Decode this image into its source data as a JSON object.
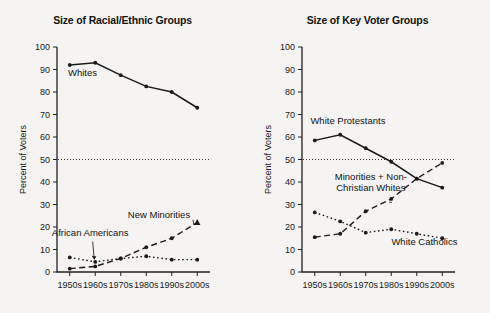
{
  "figure": {
    "background_color": "#f5f4f2",
    "ink_color": "#1a1a1a",
    "y_axis_title": "Percent of Voters"
  },
  "chart_data": [
    {
      "type": "line",
      "title": "Size of Racial/Ethnic Groups",
      "xlabel": "",
      "ylabel": "Percent of Voters",
      "categories": [
        "1950s",
        "1960s",
        "1970s",
        "1980s",
        "1990s",
        "2000s"
      ],
      "ylim": [
        0,
        100
      ],
      "yticks": [
        0,
        10,
        20,
        30,
        40,
        50,
        60,
        70,
        80,
        90,
        100
      ],
      "grid": false,
      "legend": "inline-annotations",
      "reference_line": {
        "value": 50,
        "style": "dotted"
      },
      "series": [
        {
          "name": "Whites",
          "style": "solid",
          "marker": "dot",
          "values": [
            92,
            93,
            87.5,
            82.5,
            80,
            73
          ],
          "label": "Whites",
          "label_x": "1955",
          "label_y": 87
        },
        {
          "name": "African Americans",
          "style": "dotted",
          "marker": "dot",
          "values": [
            6.5,
            4.5,
            6,
            7,
            5.5,
            5.5
          ],
          "label": "African Americans",
          "label_x": "1958",
          "label_y": 16
        },
        {
          "name": "New Minorities",
          "style": "dashed",
          "marker": "triangle",
          "values": [
            1.5,
            2.5,
            6,
            11,
            15,
            22
          ],
          "label": "New Minorities",
          "label_x": "1985",
          "label_y": 24
        }
      ]
    },
    {
      "type": "line",
      "title": "Size of Key Voter Groups",
      "xlabel": "",
      "ylabel": "Percent of Voters",
      "categories": [
        "1950s",
        "1960s",
        "1970s",
        "1980s",
        "1990s",
        "2000s"
      ],
      "ylim": [
        0,
        100
      ],
      "yticks": [
        0,
        10,
        20,
        30,
        40,
        50,
        60,
        70,
        80,
        90,
        100
      ],
      "grid": false,
      "legend": "inline-annotations",
      "reference_line": {
        "value": 50,
        "style": "dotted"
      },
      "series": [
        {
          "name": "White Protestants",
          "style": "solid",
          "marker": "dot",
          "values": [
            58.5,
            61,
            55,
            49,
            41.5,
            37.5
          ],
          "label": "White Protestants",
          "label_x": "1963",
          "label_y": 66
        },
        {
          "name": "White Catholics",
          "style": "dotted",
          "marker": "dot",
          "values": [
            26.5,
            22.5,
            17.5,
            19,
            17,
            15
          ],
          "label": "White Catholics",
          "label_x": "1993",
          "label_y": 12
        },
        {
          "name": "Minorities + Non-Christian Whites",
          "style": "dashed",
          "marker": "dot",
          "values": [
            15.5,
            17,
            27,
            32.5,
            41.5,
            48.5
          ],
          "label_line1": "Minorities + Non-",
          "label_line2": "Christian Whites",
          "label_x": "1972",
          "label_y": 41
        }
      ]
    }
  ]
}
